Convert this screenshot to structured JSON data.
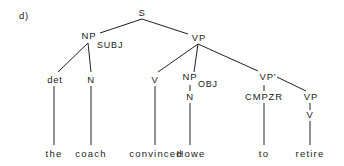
{
  "panel_label": "d)",
  "nodes": {
    "s": "S",
    "np_subj": "NP",
    "subj": "SUBJ",
    "vp": "VP",
    "det": "det",
    "n1": "N",
    "v1": "V",
    "np_obj": "NP",
    "obj": "OBJ",
    "n2": "N",
    "vp_prime": "VP'",
    "cmpzr": "CMPZR",
    "vp2": "VP",
    "v2": "V"
  },
  "words": [
    "the",
    "coach",
    "convinced",
    "Howe",
    "to",
    "retire"
  ],
  "colors": {
    "ink": "#222222",
    "background": "#ffffff"
  }
}
